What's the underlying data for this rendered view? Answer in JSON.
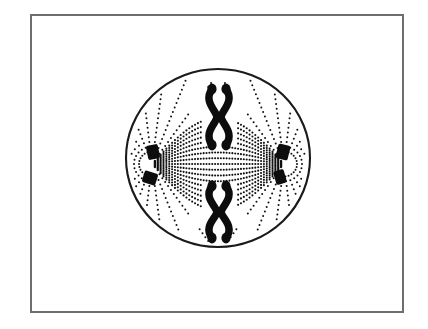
{
  "figure": {
    "domain": "Diagram",
    "stage_label": "metaphase / early anaphase",
    "background_color": "#ffffff",
    "frame": {
      "name": "figure-border",
      "x": 30,
      "y": 14,
      "width": 374,
      "height": 299,
      "stroke_color": "#6e6e72",
      "stroke_width": 2,
      "fill_color": "#ffffff"
    },
    "cell_membrane": {
      "name": "cell-membrane",
      "shape": "ellipse",
      "center_x": 218,
      "center_y": 158,
      "radius_x": 92,
      "radius_y": 89,
      "stroke_color": "#1a1a1a",
      "stroke_width": 2.1,
      "fill_color": "#ffffff"
    },
    "poles": [
      {
        "name": "left-pole",
        "side": "left",
        "x": 152,
        "y": 164,
        "centrioles": [
          {
            "name": "centriole",
            "cx": 153,
            "cy": 152,
            "rx": 6.0,
            "ry": 7.2,
            "rotation": -12
          },
          {
            "name": "centriole",
            "cx": 150,
            "cy": 178,
            "rx": 7.0,
            "ry": 6.0,
            "rotation": 18
          }
        ]
      },
      {
        "name": "right-pole",
        "side": "right",
        "x": 284,
        "y": 164,
        "centrioles": [
          {
            "name": "centriole",
            "cx": 283,
            "cy": 152,
            "rx": 6.2,
            "ry": 7.4,
            "rotation": 14
          },
          {
            "name": "centriole",
            "cx": 280,
            "cy": 177,
            "rx": 5.4,
            "ry": 7.0,
            "rotation": -16
          }
        ]
      }
    ],
    "chromosomes": [
      {
        "name": "chromosome-pair-top",
        "position": "top-equator",
        "center_x": 219,
        "center_y": 117,
        "chromatid_count": 2,
        "fill_color": "#0d0d0d",
        "length": 56,
        "description": "two curved sister chromatids pinched at the centromere"
      },
      {
        "name": "chromosome-pair-bottom",
        "position": "bottom-equator",
        "center_x": 219,
        "center_y": 212,
        "chromatid_count": 2,
        "fill_color": "#0d0d0d",
        "length": 52,
        "description": "two curved sister chromatids pinched at the centromere, mirror of the top pair"
      }
    ],
    "spindle_fibers": {
      "name": "spindle-fibers",
      "style": "dotted",
      "dot_color": "#111111",
      "dot_radius": 1.05,
      "count": 17,
      "description": "dotted microtubule lines arcing from pole to pole forming a lens-shaped spindle"
    },
    "aster_rays": {
      "name": "aster-rays",
      "style": "dotted",
      "dot_color": "#111111",
      "dot_radius": 1.0,
      "rays_per_pole": 19,
      "description": "dotted astral rays radiating outward from each centrosome toward the membrane"
    }
  },
  "chart_data": {
    "type": "diagram",
    "title": "",
    "elements": [
      "cell-membrane",
      "left-pole-centriole-pair",
      "right-pole-centriole-pair",
      "top-chromosome-pair",
      "bottom-chromosome-pair",
      "spindle-fibers",
      "aster-rays"
    ],
    "counts": {
      "poles": 2,
      "centrioles_per_pole": 2,
      "chromosome_pairs": 2,
      "chromatids_per_pair": 2
    }
  }
}
